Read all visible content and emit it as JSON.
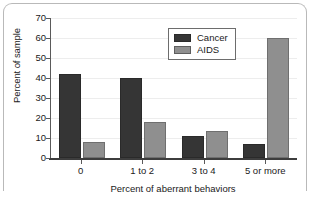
{
  "chart_data": {
    "type": "bar",
    "title": "",
    "xlabel": "Percent of aberrant behaviors",
    "ylabel": "Percent of sample",
    "categories": [
      "0",
      "1 to 2",
      "3 to 4",
      "5 or more"
    ],
    "series": [
      {
        "name": "Cancer",
        "color": "#353535",
        "values": [
          42,
          40,
          11,
          7
        ]
      },
      {
        "name": "AIDS",
        "color": "#8f8f8f",
        "values": [
          8,
          18,
          13.5,
          60
        ]
      }
    ],
    "ylim": [
      0,
      70
    ],
    "ytick_step": 10,
    "ytick_labels": [
      "0",
      "10",
      "20",
      "30",
      "40",
      "50",
      "60",
      "70"
    ],
    "grid": true,
    "legend_position": "top-center-right"
  },
  "legend": {
    "entries": [
      {
        "label": "Cancer"
      },
      {
        "label": "AIDS"
      }
    ]
  }
}
